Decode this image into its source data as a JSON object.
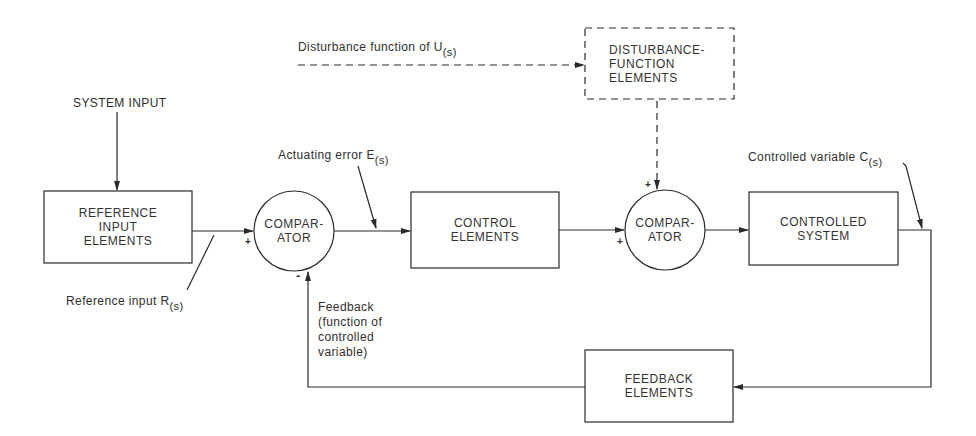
{
  "diagram": {
    "type": "closed-loop control system block diagram",
    "blocks": {
      "reference_input": {
        "lines": [
          "REFERENCE",
          "INPUT",
          "ELEMENTS"
        ]
      },
      "comparator_1": {
        "lines": [
          "COMPAR-",
          "ATOR"
        ]
      },
      "control": {
        "lines": [
          "CONTROL",
          "ELEMENTS"
        ]
      },
      "comparator_2": {
        "lines": [
          "COMPAR-",
          "ATOR"
        ]
      },
      "controlled_system": {
        "lines": [
          "CONTROLLED",
          "SYSTEM"
        ]
      },
      "disturbance": {
        "lines": [
          "DISTURBANCE-",
          "FUNCTION",
          "ELEMENTS"
        ]
      },
      "feedback": {
        "lines": [
          "FEEDBACK",
          "ELEMENTS"
        ]
      }
    },
    "labels": {
      "system_input": "SYSTEM INPUT",
      "disturbance_function": {
        "text": "Disturbance function of U",
        "sub": "(s)"
      },
      "actuating_error": {
        "text": "Actuating error E",
        "sub": "(s)"
      },
      "controlled_variable": {
        "text": "Controlled variable C",
        "sub": "(s)"
      },
      "reference_input": {
        "text": "Reference input R",
        "sub": "(s)"
      },
      "feedback_note": [
        "Feedback",
        "(function of",
        "controlled",
        "variable)"
      ]
    },
    "signs": {
      "comparator_1_plus": "+",
      "comparator_1_minus": "-",
      "comparator_2_plus_left": "+",
      "comparator_2_plus_top": "+"
    },
    "colors": {
      "line": "#2a2a2a",
      "background": "#ffffff"
    }
  }
}
